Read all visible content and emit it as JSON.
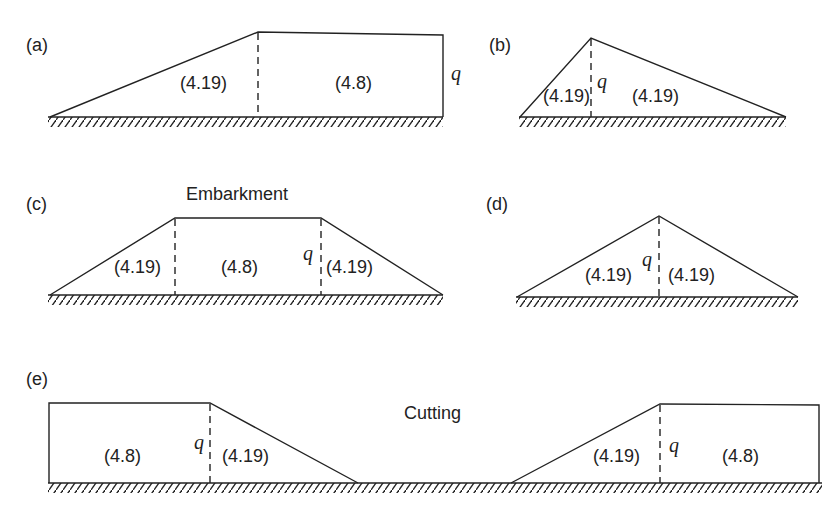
{
  "panels": {
    "a": {
      "label": "(a)",
      "regions": [
        "(4.19)",
        "(4.8)"
      ],
      "q": "q"
    },
    "b": {
      "label": "(b)",
      "regions": [
        "(4.19)",
        "(4.19)"
      ],
      "q": "q"
    },
    "c": {
      "label": "(c)",
      "title": "Embarkment",
      "regions": [
        "(4.19)",
        "(4.8)",
        "(4.19)"
      ],
      "q": "q"
    },
    "d": {
      "label": "(d)",
      "regions": [
        "(4.19)",
        "(4.19)"
      ],
      "q": "q"
    },
    "e": {
      "label": "(e)",
      "title": "Cutting",
      "regions": [
        "(4.8)",
        "(4.19)",
        "(4.19)",
        "(4.8)"
      ],
      "q_left": "q",
      "q_right": "q"
    }
  },
  "colors": {
    "stroke": "#222222",
    "background": "#ffffff"
  }
}
